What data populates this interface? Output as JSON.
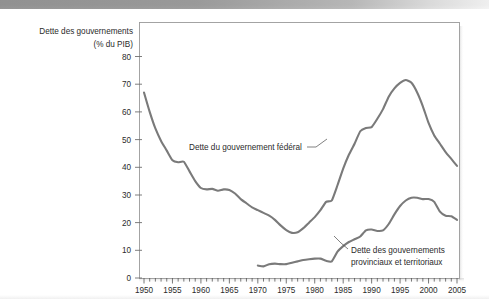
{
  "figure": {
    "background_color": "#ffffff",
    "band_color": "#8d8d8d",
    "line_color": "#7a7a7a",
    "frame_color": "#9a9a9a",
    "text_color": "#2b2b2b"
  },
  "chart_data": {
    "type": "line",
    "title": "",
    "ylabel_line1": "Dette des gouvernements",
    "ylabel_line2": "(% du PIB)",
    "xlabel": "",
    "xlim": [
      1950,
      2005
    ],
    "ylim": [
      0,
      80
    ],
    "grid": false,
    "legend_position": "inline-annotations",
    "y_ticks": [
      0,
      10,
      20,
      30,
      40,
      50,
      60,
      70,
      80
    ],
    "y_tick_labels": [
      "0",
      "10",
      "20",
      "30",
      "40",
      "50",
      "60",
      "70",
      "80"
    ],
    "x_ticks": [
      1950,
      1955,
      1960,
      1965,
      1970,
      1975,
      1980,
      1985,
      1990,
      1995,
      2000,
      2005
    ],
    "x_tick_labels": [
      "1950",
      "1955",
      "1960",
      "1965",
      "1970",
      "1975",
      "1980",
      "1985",
      "1990",
      "1995",
      "2000",
      "2005"
    ],
    "x_minor_tick_step": 1,
    "annotations": [
      {
        "name": "federal-annotation",
        "text_line1": "Dette du gouvernement fédéral",
        "text_line2": "",
        "target_year": 1984,
        "target_value": 46
      },
      {
        "name": "provincial-annotation",
        "text_line1": "Dette des gouvernements",
        "text_line2": "provinciaux et territoriaux",
        "target_year": 1986,
        "target_value": 13
      }
    ],
    "series": [
      {
        "name": "Dette du gouvernement fédéral",
        "x": [
          1950,
          1951,
          1952,
          1953,
          1954,
          1955,
          1956,
          1957,
          1958,
          1959,
          1960,
          1961,
          1962,
          1963,
          1964,
          1965,
          1966,
          1967,
          1968,
          1969,
          1970,
          1971,
          1972,
          1973,
          1974,
          1975,
          1976,
          1977,
          1978,
          1979,
          1980,
          1981,
          1982,
          1983,
          1984,
          1985,
          1986,
          1987,
          1988,
          1989,
          1990,
          1991,
          1992,
          1993,
          1994,
          1995,
          1996,
          1997,
          1998,
          1999,
          2000,
          2001,
          2002,
          2003,
          2004,
          2005
        ],
        "values": [
          67.0,
          60.0,
          54.0,
          49.5,
          46.0,
          42.5,
          41.8,
          42.0,
          38.5,
          35.0,
          32.5,
          32.0,
          32.2,
          31.5,
          32.0,
          31.8,
          30.5,
          28.5,
          27.0,
          25.5,
          24.5,
          23.5,
          22.5,
          21.0,
          19.0,
          17.3,
          16.3,
          16.5,
          18.0,
          20.0,
          22.0,
          24.5,
          27.5,
          28.0,
          33.5,
          39.5,
          44.5,
          48.5,
          53.0,
          54.2,
          54.5,
          57.5,
          61.0,
          65.5,
          68.5,
          70.5,
          71.5,
          70.5,
          67.0,
          62.0,
          56.0,
          51.5,
          48.5,
          45.5,
          43.0,
          40.5
        ]
      },
      {
        "name": "Dette des gouvernements provinciaux et territoriaux",
        "x": [
          1970,
          1971,
          1972,
          1973,
          1974,
          1975,
          1976,
          1977,
          1978,
          1979,
          1980,
          1981,
          1982,
          1983,
          1984,
          1985,
          1986,
          1987,
          1988,
          1989,
          1990,
          1991,
          1992,
          1993,
          1994,
          1995,
          1996,
          1997,
          1998,
          1999,
          2000,
          2001,
          2002,
          2003,
          2004,
          2005
        ],
        "values": [
          4.5,
          4.2,
          5.0,
          5.2,
          5.0,
          5.0,
          5.5,
          6.0,
          6.5,
          6.8,
          7.0,
          7.0,
          6.2,
          6.0,
          9.5,
          11.5,
          13.0,
          14.0,
          15.0,
          17.2,
          17.5,
          17.0,
          17.2,
          19.5,
          23.0,
          26.0,
          28.0,
          29.0,
          29.0,
          28.5,
          28.5,
          27.5,
          24.0,
          22.5,
          22.3,
          21.0
        ]
      }
    ]
  }
}
